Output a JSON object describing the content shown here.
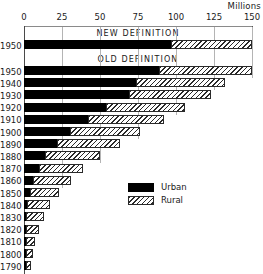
{
  "chart_data": {
    "type": "bar",
    "orientation": "horizontal",
    "stacked": true,
    "title": "",
    "unit_label": "Millions",
    "xlabel": "",
    "ylabel": "",
    "xlim": [
      0,
      150
    ],
    "xticks": [
      0,
      25,
      50,
      75,
      100,
      125,
      150
    ],
    "xtick_labels": [
      "0",
      "25",
      "50",
      "75",
      "100",
      "125",
      "150"
    ],
    "grid": true,
    "legend": {
      "position": "bottom-right",
      "entries": [
        {
          "name": "Urban",
          "pattern": "solid-black"
        },
        {
          "name": "Rural",
          "pattern": "diagonal-hatch"
        }
      ]
    },
    "section_labels": [
      {
        "text": "NEW DEFINITION",
        "at_x": 75
      },
      {
        "text": "OLD DEFINITION",
        "at_x": 75
      }
    ],
    "series": [
      {
        "name": "Urban",
        "pattern": "solid-black"
      },
      {
        "name": "Rural",
        "pattern": "diagonal-hatch"
      }
    ],
    "sections": [
      {
        "name": "NEW DEFINITION",
        "categories": [
          "1950"
        ],
        "rows": [
          {
            "year": "1950",
            "urban": 97,
            "rural": 53,
            "total": 150
          }
        ]
      },
      {
        "name": "OLD DEFINITION",
        "categories": [
          "1950",
          "1940",
          "1930",
          "1920",
          "1910",
          "1900",
          "1890",
          "1880",
          "1870",
          "1860",
          "1850",
          "1840",
          "1830",
          "1820",
          "1810",
          "1800",
          "1790"
        ],
        "rows": [
          {
            "year": "1950",
            "urban": 89,
            "rural": 61,
            "total": 150
          },
          {
            "year": "1940",
            "urban": 74,
            "rural": 58,
            "total": 132
          },
          {
            "year": "1930",
            "urban": 69,
            "rural": 54,
            "total": 123
          },
          {
            "year": "1920",
            "urban": 54,
            "rural": 52,
            "total": 106
          },
          {
            "year": "1910",
            "urban": 42,
            "rural": 50,
            "total": 92
          },
          {
            "year": "1900",
            "urban": 30,
            "rural": 46,
            "total": 76
          },
          {
            "year": "1890",
            "urban": 22,
            "rural": 41,
            "total": 63
          },
          {
            "year": "1880",
            "urban": 14,
            "rural": 36,
            "total": 50
          },
          {
            "year": "1870",
            "urban": 10,
            "rural": 29,
            "total": 39
          },
          {
            "year": "1860",
            "urban": 6,
            "rural": 25,
            "total": 31
          },
          {
            "year": "1850",
            "urban": 4,
            "rural": 19,
            "total": 23
          },
          {
            "year": "1840",
            "urban": 2,
            "rural": 15,
            "total": 17
          },
          {
            "year": "1830",
            "urban": 1,
            "rural": 12,
            "total": 13
          },
          {
            "year": "1820",
            "urban": 1,
            "rural": 9,
            "total": 10
          },
          {
            "year": "1810",
            "urban": 1,
            "rural": 6,
            "total": 7
          },
          {
            "year": "1800",
            "urban": 0.3,
            "rural": 5,
            "total": 5.3
          },
          {
            "year": "1790",
            "urban": 0.2,
            "rural": 3.7,
            "total": 3.9
          }
        ]
      }
    ]
  }
}
